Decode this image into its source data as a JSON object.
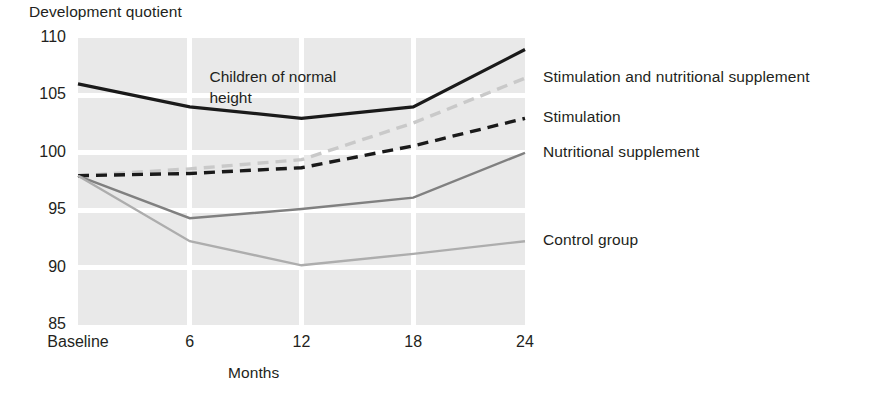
{
  "chart_data": {
    "type": "line",
    "title": "",
    "ylabel": "Development quotient",
    "xlabel": "Months",
    "categories": [
      "Baseline",
      "6",
      "12",
      "18",
      "24"
    ],
    "x": [
      0,
      6,
      12,
      18,
      24
    ],
    "ylim": [
      85,
      110
    ],
    "yticks": [
      85,
      90,
      95,
      100,
      105,
      110
    ],
    "grid": true,
    "legend_position": "right-inline",
    "annotations": [
      {
        "text": "Children of normal\nheight",
        "x": 12,
        "y": 106.5
      }
    ],
    "series": [
      {
        "name": "Children of normal height",
        "values": [
          106,
          104,
          103,
          104,
          109
        ],
        "color": "#1a1a1a",
        "style": "solid",
        "width": 3.2
      },
      {
        "name": "Stimulation and nutritional supplement",
        "values": [
          98,
          98.6,
          99.4,
          102.6,
          106.5
        ],
        "color": "#c9c9c9",
        "style": "dashed",
        "width": 3.4
      },
      {
        "name": "Stimulation",
        "values": [
          98,
          98.2,
          98.7,
          100.6,
          103
        ],
        "color": "#1a1a1a",
        "style": "dashed",
        "width": 3.4
      },
      {
        "name": "Nutritional supplement",
        "values": [
          98,
          94.3,
          95.1,
          96.1,
          100
        ],
        "color": "#808080",
        "style": "solid",
        "width": 2.4
      },
      {
        "name": "Control group",
        "values": [
          98,
          92.3,
          90.2,
          91.2,
          92.3
        ],
        "color": "#adadad",
        "style": "solid",
        "width": 2.4
      }
    ]
  },
  "ytick_labels": [
    "110",
    "105",
    "100",
    "95",
    "90",
    "85"
  ],
  "xtick_labels": [
    "Baseline",
    "6",
    "12",
    "18",
    "24"
  ],
  "legend": [
    {
      "label": "Stimulation and nutritional supplement"
    },
    {
      "label": "Stimulation"
    },
    {
      "label": "Nutritional supplement"
    },
    {
      "label": "Control group"
    }
  ],
  "annotation_text": "Children of normal\nheight",
  "axis_titles": {
    "y": "Development quotient",
    "x": "Months"
  }
}
